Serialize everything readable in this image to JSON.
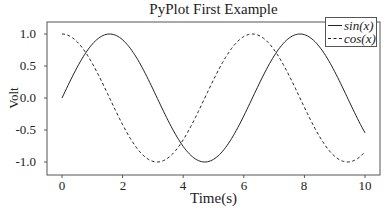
{
  "chart_data": {
    "type": "line",
    "title": "PyPlot First Example",
    "xlabel": "Time(s)",
    "ylabel": "Volt",
    "xlim": [
      -0.5,
      10.5
    ],
    "ylim": [
      -1.2,
      1.2
    ],
    "xticks": [
      0,
      2,
      4,
      6,
      8,
      10
    ],
    "xtick_labels": [
      "0",
      "2",
      "4",
      "6",
      "8",
      "10"
    ],
    "yticks": [
      1.0,
      0.5,
      0.0,
      -0.5,
      -1.0
    ],
    "ytick_labels": [
      "1.0",
      "0.5",
      "0.0",
      "-0.5",
      "-1.0"
    ],
    "grid": false,
    "legend_position": "upper right",
    "series": [
      {
        "name": "sin(x)",
        "style": "solid",
        "color": "#222222",
        "function": "sin",
        "x_range": [
          0,
          10
        ]
      },
      {
        "name": "cos(x)",
        "style": "dashed",
        "color": "#222222",
        "function": "cos",
        "x_range": [
          0,
          10
        ]
      }
    ],
    "sample_points": {
      "x": [
        0,
        1,
        2,
        3,
        4,
        5,
        6,
        7,
        8,
        9,
        10
      ],
      "sin": [
        0.0,
        0.84,
        0.91,
        0.14,
        -0.76,
        -0.96,
        -0.28,
        0.66,
        0.99,
        0.41,
        -0.54
      ],
      "cos": [
        1.0,
        0.54,
        -0.42,
        -0.99,
        -0.65,
        0.28,
        0.96,
        0.75,
        -0.15,
        -0.91,
        -0.84
      ]
    }
  },
  "legend": {
    "items": [
      {
        "label": "sin(x)",
        "style": "solid"
      },
      {
        "label": "cos(x)",
        "style": "dashed"
      }
    ]
  },
  "colors": {
    "line": "#222222",
    "frame": "#555555",
    "background": "#ffffff"
  }
}
